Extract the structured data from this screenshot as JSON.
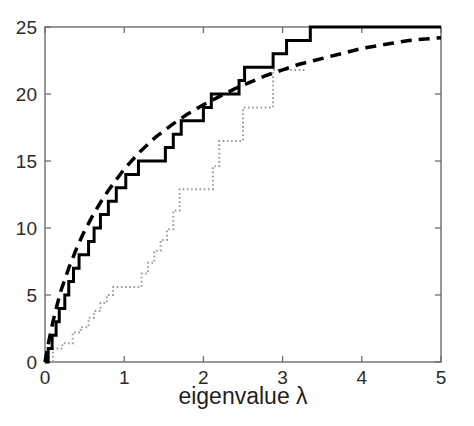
{
  "chart_data": {
    "type": "line",
    "title": "",
    "subtitle": "",
    "xlabel": "eigenvalue λ",
    "ylabel": "",
    "xlim": [
      0,
      5
    ],
    "ylim": [
      0,
      25
    ],
    "xticks": [
      0,
      1,
      2,
      3,
      4,
      5
    ],
    "xtick_labels": [
      "0",
      "1",
      "2",
      "3",
      "4",
      "5"
    ],
    "yticks": [
      0,
      5,
      10,
      15,
      20,
      25
    ],
    "ytick_labels": [
      "0",
      "5",
      "10",
      "15",
      "20",
      "25"
    ],
    "grid": false,
    "legend": "none",
    "axis_box": true,
    "series": [
      {
        "name": "empirical-counting-function-solid",
        "style": "solid",
        "color": "#000000",
        "linewidth": 3,
        "shape": "staircase",
        "points": [
          [
            0.0,
            0
          ],
          [
            0.04,
            0
          ],
          [
            0.04,
            1
          ],
          [
            0.09,
            1
          ],
          [
            0.09,
            2
          ],
          [
            0.14,
            2
          ],
          [
            0.14,
            3
          ],
          [
            0.18,
            3
          ],
          [
            0.18,
            4
          ],
          [
            0.25,
            4
          ],
          [
            0.25,
            5
          ],
          [
            0.3,
            5
          ],
          [
            0.3,
            6
          ],
          [
            0.36,
            6
          ],
          [
            0.36,
            7
          ],
          [
            0.43,
            7
          ],
          [
            0.43,
            8
          ],
          [
            0.55,
            8
          ],
          [
            0.55,
            9
          ],
          [
            0.62,
            9
          ],
          [
            0.62,
            10
          ],
          [
            0.7,
            10
          ],
          [
            0.7,
            11
          ],
          [
            0.8,
            11
          ],
          [
            0.8,
            12
          ],
          [
            0.9,
            12
          ],
          [
            0.9,
            13
          ],
          [
            1.02,
            13
          ],
          [
            1.02,
            14
          ],
          [
            1.18,
            14
          ],
          [
            1.18,
            15
          ],
          [
            1.52,
            15
          ],
          [
            1.52,
            16
          ],
          [
            1.62,
            16
          ],
          [
            1.62,
            17
          ],
          [
            1.72,
            17
          ],
          [
            1.72,
            18
          ],
          [
            2.0,
            18
          ],
          [
            2.0,
            19
          ],
          [
            2.1,
            19
          ],
          [
            2.1,
            20
          ],
          [
            2.45,
            20
          ],
          [
            2.45,
            21
          ],
          [
            2.52,
            21
          ],
          [
            2.52,
            22
          ],
          [
            2.88,
            22
          ],
          [
            2.88,
            23
          ],
          [
            3.05,
            23
          ],
          [
            3.05,
            24
          ],
          [
            3.35,
            24
          ],
          [
            3.35,
            25
          ],
          [
            5.0,
            25
          ]
        ]
      },
      {
        "name": "weyl-law-smooth-dashed",
        "style": "dashed",
        "color": "#000000",
        "linewidth": 3.5,
        "shape": "smooth",
        "points": [
          [
            0.0,
            0.0
          ],
          [
            0.05,
            1.6
          ],
          [
            0.1,
            3.0
          ],
          [
            0.15,
            4.2
          ],
          [
            0.2,
            5.3
          ],
          [
            0.3,
            7.0
          ],
          [
            0.4,
            8.5
          ],
          [
            0.5,
            9.8
          ],
          [
            0.6,
            10.9
          ],
          [
            0.7,
            11.9
          ],
          [
            0.8,
            12.8
          ],
          [
            0.9,
            13.6
          ],
          [
            1.0,
            14.4
          ],
          [
            1.2,
            15.7
          ],
          [
            1.4,
            16.8
          ],
          [
            1.6,
            17.7
          ],
          [
            1.8,
            18.5
          ],
          [
            2.0,
            19.2
          ],
          [
            2.2,
            19.8
          ],
          [
            2.4,
            20.4
          ],
          [
            2.6,
            20.9
          ],
          [
            2.8,
            21.4
          ],
          [
            3.0,
            21.8
          ],
          [
            3.2,
            22.2
          ],
          [
            3.4,
            22.5
          ],
          [
            3.6,
            22.8
          ],
          [
            3.8,
            23.1
          ],
          [
            4.0,
            23.4
          ],
          [
            4.2,
            23.6
          ],
          [
            4.4,
            23.8
          ],
          [
            4.6,
            24.0
          ],
          [
            4.8,
            24.1
          ],
          [
            5.0,
            24.2
          ]
        ]
      },
      {
        "name": "second-counting-function-dotted",
        "style": "dotted",
        "color": "#9a9a9a",
        "linewidth": 2,
        "shape": "staircase",
        "points": [
          [
            0.05,
            0
          ],
          [
            0.1,
            0
          ],
          [
            0.1,
            1
          ],
          [
            0.22,
            1
          ],
          [
            0.22,
            1.4
          ],
          [
            0.35,
            1.4
          ],
          [
            0.35,
            2.2
          ],
          [
            0.45,
            2.2
          ],
          [
            0.45,
            2.6
          ],
          [
            0.55,
            2.6
          ],
          [
            0.55,
            3.3
          ],
          [
            0.62,
            3.3
          ],
          [
            0.62,
            3.8
          ],
          [
            0.7,
            3.8
          ],
          [
            0.7,
            4.4
          ],
          [
            0.78,
            4.4
          ],
          [
            0.78,
            5.0
          ],
          [
            0.86,
            5.0
          ],
          [
            0.86,
            5.6
          ],
          [
            1.22,
            5.6
          ],
          [
            1.22,
            6.6
          ],
          [
            1.3,
            6.6
          ],
          [
            1.3,
            7.4
          ],
          [
            1.38,
            7.4
          ],
          [
            1.38,
            8.3
          ],
          [
            1.46,
            8.3
          ],
          [
            1.46,
            9.1
          ],
          [
            1.54,
            9.1
          ],
          [
            1.54,
            9.9
          ],
          [
            1.62,
            9.9
          ],
          [
            1.62,
            11.3
          ],
          [
            1.7,
            11.3
          ],
          [
            1.7,
            12.9
          ],
          [
            2.12,
            12.9
          ],
          [
            2.12,
            14.6
          ],
          [
            2.2,
            14.6
          ],
          [
            2.2,
            16.5
          ],
          [
            2.5,
            16.5
          ],
          [
            2.5,
            19.0
          ],
          [
            2.88,
            19.0
          ],
          [
            2.88,
            21.8
          ],
          [
            3.3,
            21.8
          ]
        ]
      }
    ]
  },
  "axis": {
    "x_label": "eigenvalue λ",
    "x_ticks": [
      "0",
      "1",
      "2",
      "3",
      "4",
      "5"
    ],
    "y_ticks": [
      "0",
      "5",
      "10",
      "15",
      "20",
      "25"
    ]
  },
  "colors": {
    "axis": "#6d6d6d",
    "solid_curve": "#000000",
    "dashed_curve": "#000000",
    "dotted_curve": "#9a9a9a",
    "text": "#2b2b2b",
    "background": "#ffffff"
  }
}
